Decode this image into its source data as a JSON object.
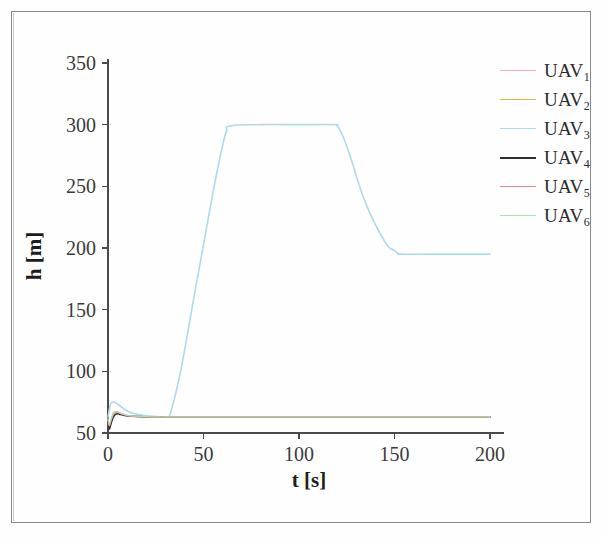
{
  "chart_data": {
    "type": "line",
    "title": "",
    "xlabel": "t [s]",
    "ylabel": "h [m]",
    "xlim": [
      0,
      200
    ],
    "ylim": [
      50,
      350
    ],
    "xticks": [
      0,
      50,
      100,
      150,
      200
    ],
    "yticks": [
      50,
      100,
      150,
      200,
      250,
      300,
      350
    ],
    "grid": false,
    "legend_position": "right-top",
    "series": [
      {
        "name": "UAV_1",
        "label": "UAV",
        "subscript": "1",
        "color": "#f2a8cd",
        "width": 1.2,
        "x": [
          0,
          0.6,
          1.2,
          2,
          3,
          4.5,
          6,
          8,
          11,
          15,
          20,
          26,
          31,
          31.5,
          62,
          63,
          120,
          121,
          151,
          152,
          200
        ],
        "y": [
          58,
          54,
          56,
          60,
          64,
          66,
          65.5,
          64.6,
          63.8,
          63.3,
          63.1,
          63,
          63,
          63,
          63,
          63,
          63,
          63,
          63,
          63,
          63
        ]
      },
      {
        "name": "UAV_2",
        "label": "UAV",
        "subscript": "2",
        "color": "#f0b43c",
        "width": 1.2,
        "x": [
          0,
          0.6,
          1.2,
          2,
          3,
          4.5,
          6,
          8,
          11,
          15,
          20,
          26,
          31,
          31.5,
          62,
          63,
          120,
          121,
          151,
          152,
          200
        ],
        "y": [
          60,
          55.5,
          57,
          61,
          65,
          66.5,
          65.8,
          64.8,
          63.9,
          63.4,
          63.1,
          63,
          63,
          63,
          63,
          63,
          63,
          63,
          63,
          63,
          63
        ]
      },
      {
        "name": "UAV_3",
        "label": "UAV",
        "subscript": "3",
        "color": "#aed9ee",
        "width": 1.6,
        "x": [
          0,
          0.8,
          1.6,
          3,
          5,
          8,
          12,
          18,
          25,
          31,
          33,
          38,
          45,
          55,
          60,
          62,
          64,
          80,
          100,
          118,
          120,
          122,
          126,
          135,
          145,
          150,
          152,
          154,
          170,
          200
        ],
        "y": [
          63,
          70,
          74,
          75,
          73.5,
          70,
          66.5,
          64.4,
          63.4,
          63.1,
          68,
          100,
          160,
          245,
          283,
          294,
          299,
          300,
          300,
          300,
          299,
          294,
          278,
          236,
          205,
          198,
          195.5,
          195,
          195,
          195
        ]
      },
      {
        "name": "UAV_4",
        "label": "UAV",
        "subscript": "4",
        "color": "#2e2e2e",
        "width": 1.5,
        "x": [
          0,
          0.6,
          1.2,
          2,
          3,
          4.5,
          6,
          8,
          11,
          15,
          20,
          26,
          31,
          31.5,
          62,
          63,
          120,
          121,
          151,
          152,
          200
        ],
        "y": [
          59,
          53.5,
          55.5,
          59.5,
          63.5,
          65.5,
          65.2,
          64.4,
          63.7,
          63.3,
          63.1,
          63,
          63,
          63,
          63,
          63,
          63,
          63,
          63,
          63,
          63
        ]
      },
      {
        "name": "UAV_5",
        "label": "UAV",
        "subscript": "5",
        "color": "#f4868c",
        "width": 1.4,
        "x": [
          0,
          0.6,
          1.2,
          2,
          3,
          4.5,
          6,
          8,
          11,
          15,
          20,
          26,
          31,
          31.5,
          62,
          63,
          120,
          121,
          151,
          152,
          200
        ],
        "y": [
          61,
          56,
          58,
          62,
          66,
          67,
          66.2,
          65,
          64,
          63.5,
          63.2,
          63,
          63,
          63,
          63,
          63,
          63,
          63,
          63,
          63,
          63
        ]
      },
      {
        "name": "UAV_6",
        "label": "UAV",
        "subscript": "6",
        "color": "#a7e0b4",
        "width": 1.2,
        "x": [
          0,
          0.6,
          1.2,
          2,
          3,
          4.5,
          6,
          8,
          11,
          15,
          20,
          26,
          31,
          31.5,
          62,
          63,
          120,
          121,
          151,
          152,
          200
        ],
        "y": [
          62,
          57,
          59,
          63,
          66.5,
          67.2,
          66.4,
          65.2,
          64.1,
          63.6,
          63.2,
          63,
          63,
          63,
          63,
          63,
          63,
          63,
          63,
          63,
          63
        ]
      }
    ]
  },
  "axes": {
    "x_title": "t [s]",
    "y_title": "h [m]",
    "x_tick_labels": [
      "0",
      "50",
      "100",
      "150",
      "200"
    ],
    "y_tick_labels": [
      "50",
      "100",
      "150",
      "200",
      "250",
      "300",
      "350"
    ]
  },
  "legend": {
    "items": [
      {
        "label": "UAV",
        "subscript": "1",
        "color": "#f2a8cd",
        "width": 1.2
      },
      {
        "label": "UAV",
        "subscript": "2",
        "color": "#f0b43c",
        "width": 1.2
      },
      {
        "label": "UAV",
        "subscript": "3",
        "color": "#aed9ee",
        "width": 1.6
      },
      {
        "label": "UAV",
        "subscript": "4",
        "color": "#2e2e2e",
        "width": 2.2
      },
      {
        "label": "UAV",
        "subscript": "5",
        "color": "#f4868c",
        "width": 1.6
      },
      {
        "label": "UAV",
        "subscript": "6",
        "color": "#a7e0b4",
        "width": 1.2
      }
    ]
  },
  "style": {
    "axis_color": "#4a4a4a",
    "text_color": "#3b3b3b",
    "page_background": "#fefefe"
  }
}
